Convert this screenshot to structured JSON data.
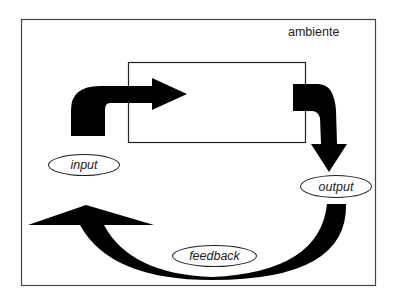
{
  "diagram": {
    "environment_label": "ambiente",
    "nodes": {
      "input": "input",
      "output": "output",
      "feedback": "feedback"
    },
    "colors": {
      "stroke": "#222222",
      "arrow_fill": "#000000",
      "background": "#ffffff"
    }
  }
}
